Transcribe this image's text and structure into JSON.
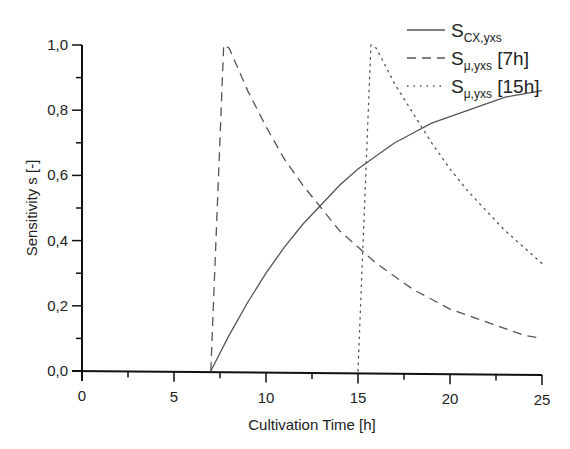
{
  "chart_data": {
    "type": "line",
    "title": "",
    "xlabel": "Cultivation Time [h]",
    "ylabel": "Sensitivity s [-]",
    "xlim": [
      0,
      25
    ],
    "ylim": [
      0.0,
      1.0
    ],
    "x_ticks": [
      "0",
      "5",
      "10",
      "15",
      "20",
      "25"
    ],
    "y_ticks": [
      "0,0",
      "0,2",
      "0,4",
      "0,6",
      "0,8",
      "1,0"
    ],
    "grid": false,
    "legend_position": "top-right",
    "series": [
      {
        "name": "S_CX,yxs",
        "legend_main": "S",
        "legend_sub": "CX,yxs",
        "legend_suffix": "",
        "style": "solid",
        "x": [
          7,
          8,
          9,
          10,
          11,
          12,
          13,
          14,
          15,
          16,
          17,
          18,
          19,
          20,
          21,
          22,
          23,
          24,
          25
        ],
        "y": [
          0.0,
          0.11,
          0.21,
          0.3,
          0.38,
          0.45,
          0.51,
          0.57,
          0.62,
          0.66,
          0.7,
          0.73,
          0.76,
          0.78,
          0.8,
          0.82,
          0.84,
          0.85,
          0.86
        ]
      },
      {
        "name": "S_μ,yxs [7h]",
        "legend_main": "S",
        "legend_sub": "μ,yxs",
        "legend_suffix": " [7h]",
        "style": "dashed",
        "x": [
          7,
          7.7,
          8,
          9,
          10,
          11,
          12,
          13,
          14,
          15,
          16,
          17,
          18,
          19,
          20,
          21,
          22,
          23,
          24,
          25
        ],
        "y": [
          0.0,
          1.0,
          0.99,
          0.86,
          0.75,
          0.65,
          0.57,
          0.5,
          0.43,
          0.38,
          0.33,
          0.29,
          0.25,
          0.22,
          0.19,
          0.17,
          0.15,
          0.13,
          0.11,
          0.1
        ]
      },
      {
        "name": "S_μ,yxs [15h]",
        "legend_main": "S",
        "legend_sub": "μ,yxs",
        "legend_suffix": " [15h]",
        "style": "dotted",
        "x": [
          15,
          15.7,
          16,
          17,
          18,
          19,
          20,
          21,
          22,
          23,
          24,
          25
        ],
        "y": [
          0.0,
          1.0,
          0.99,
          0.88,
          0.79,
          0.7,
          0.62,
          0.55,
          0.49,
          0.43,
          0.38,
          0.33
        ]
      }
    ]
  }
}
